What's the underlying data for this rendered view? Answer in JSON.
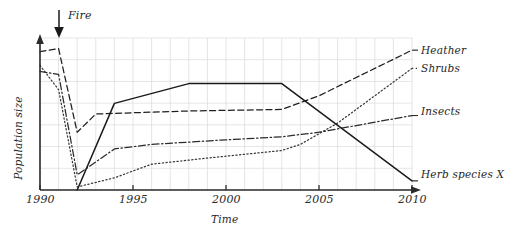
{
  "chart_data": {
    "type": "line",
    "title": "",
    "xlabel": "Time",
    "ylabel": "Population size",
    "xlim": [
      1990,
      2010
    ],
    "ylim": [
      0,
      100
    ],
    "xticks": [
      1990,
      1995,
      2000,
      2005,
      2010
    ],
    "xticklabels": [
      "1990",
      "1995",
      "2000",
      "2005",
      "2010"
    ],
    "yticks": [],
    "yticklabels": [],
    "grid": true,
    "grid_color": "#d9d9d9",
    "grid_minor_step_x": 1,
    "legend_position": "right-of-axes",
    "annotations": [
      {
        "name": "fire-event",
        "label": "Fire",
        "x": 1991,
        "type": "down-arrow"
      }
    ],
    "series": [
      {
        "name": "Heather",
        "label": "Heather",
        "style": "dashed",
        "color": "#1f1f1f",
        "points": [
          {
            "x": 1990,
            "y": 91
          },
          {
            "x": 1991,
            "y": 93
          },
          {
            "x": 1992,
            "y": 38
          },
          {
            "x": 1993,
            "y": 50
          },
          {
            "x": 1998,
            "y": 52
          },
          {
            "x": 2003,
            "y": 53
          },
          {
            "x": 2005,
            "y": 62
          },
          {
            "x": 2010,
            "y": 92
          }
        ]
      },
      {
        "name": "Shrubs",
        "label": "Shrubs",
        "style": "dotted",
        "color": "#3a3a3a",
        "points": [
          {
            "x": 1990,
            "y": 82
          },
          {
            "x": 1991,
            "y": 66
          },
          {
            "x": 1992,
            "y": 2
          },
          {
            "x": 1994,
            "y": 8
          },
          {
            "x": 1996,
            "y": 17
          },
          {
            "x": 1999,
            "y": 21
          },
          {
            "x": 2003,
            "y": 26
          },
          {
            "x": 2004,
            "y": 30
          },
          {
            "x": 2006,
            "y": 44
          },
          {
            "x": 2010,
            "y": 80
          }
        ]
      },
      {
        "name": "Insects",
        "label": "Insects",
        "style": "dash-dot",
        "color": "#2b2b2b",
        "points": [
          {
            "x": 1990,
            "y": 78
          },
          {
            "x": 1991,
            "y": 76
          },
          {
            "x": 1992,
            "y": 10
          },
          {
            "x": 1994,
            "y": 27
          },
          {
            "x": 1996,
            "y": 30
          },
          {
            "x": 2000,
            "y": 33
          },
          {
            "x": 2003,
            "y": 35
          },
          {
            "x": 2005,
            "y": 38
          },
          {
            "x": 2010,
            "y": 49
          }
        ]
      },
      {
        "name": "Herb species X",
        "label": "Herb species X",
        "style": "solid",
        "color": "#1a1a1a",
        "points": [
          {
            "x": 1992,
            "y": 0
          },
          {
            "x": 1994,
            "y": 57
          },
          {
            "x": 1998,
            "y": 70
          },
          {
            "x": 2003,
            "y": 70
          },
          {
            "x": 2010,
            "y": 6
          }
        ]
      }
    ]
  },
  "axes": {
    "y_axis_label": "Population size",
    "x_axis_label": "Time",
    "tick_1990": "1990",
    "tick_1995": "1995",
    "tick_2000": "2000",
    "tick_2005": "2005",
    "tick_2010": "2010"
  },
  "labels": {
    "fire": "Fire",
    "heather": "Heather",
    "shrubs": "Shrubs",
    "insects": "Insects",
    "herb_species_x": "Herb species X"
  }
}
